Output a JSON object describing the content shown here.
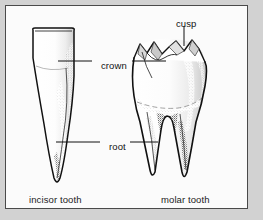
{
  "figure": {
    "background_color": "#fbfbfb",
    "margin_color": "#d2d2d2",
    "frame_color": "#4a4a4a",
    "ink_color": "#111111"
  },
  "annotations": {
    "cusp": "cusp",
    "crown": "crown",
    "root": "root"
  },
  "captions": {
    "incisor": "incisor tooth",
    "molar": "molar tooth"
  },
  "specimens": [
    {
      "name": "incisor tooth",
      "parts": [
        "crown",
        "root"
      ],
      "root_count": 1
    },
    {
      "name": "molar tooth",
      "parts": [
        "cusp",
        "crown",
        "root"
      ],
      "root_count": 2
    }
  ]
}
